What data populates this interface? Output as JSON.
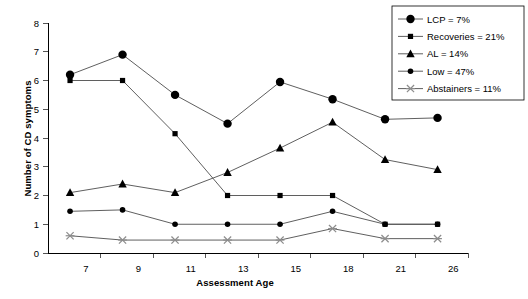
{
  "chart_data": {
    "type": "line",
    "title": "",
    "xlabel": "Assessment Age",
    "ylabel": "Number of CD symptoms",
    "categories": [
      "7",
      "9",
      "11",
      "13",
      "15",
      "18",
      "21",
      "26"
    ],
    "ylim": [
      0,
      8
    ],
    "yticks": [
      "0",
      "1",
      "2",
      "3",
      "4",
      "5",
      "6",
      "7",
      "8"
    ],
    "grid": false,
    "legend_position": "top-right",
    "series": [
      {
        "name": "LCP = 7%",
        "marker": "circle-large",
        "values": [
          6.2,
          6.9,
          5.5,
          4.5,
          5.95,
          5.35,
          4.65,
          4.7
        ]
      },
      {
        "name": "Recoveries = 21%",
        "marker": "square-small",
        "values": [
          6.0,
          6.0,
          4.15,
          2.0,
          2.0,
          2.0,
          1.0,
          1.0
        ]
      },
      {
        "name": "AL = 14%",
        "marker": "triangle",
        "values": [
          2.1,
          2.4,
          2.1,
          2.8,
          3.65,
          4.55,
          3.25,
          2.9
        ]
      },
      {
        "name": "Low = 47%",
        "marker": "circle-small",
        "values": [
          1.45,
          1.5,
          1.0,
          1.0,
          1.0,
          1.45,
          1.0,
          1.0
        ]
      },
      {
        "name": "Abstainers = 11%",
        "marker": "cross-x",
        "values": [
          0.6,
          0.45,
          0.45,
          0.45,
          0.45,
          0.85,
          0.5,
          0.5
        ]
      }
    ],
    "colors": {
      "line": "#4d4d4d",
      "marker_dark": "#000000",
      "marker_light": "#8c8c8c",
      "axis": "#000000"
    }
  }
}
